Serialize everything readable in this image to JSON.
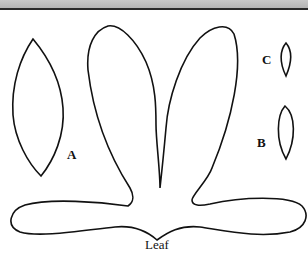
{
  "diagram": {
    "labels": {
      "a": "A",
      "b": "B",
      "c": "C",
      "leaf": "Leaf"
    },
    "colors": {
      "stroke": "#111111",
      "header_band": "#bdbdbd",
      "header_line": "#2a2a2a"
    }
  }
}
